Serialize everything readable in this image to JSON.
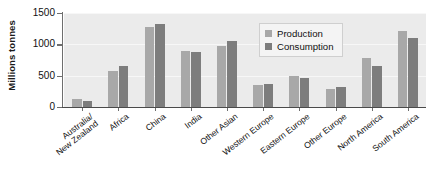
{
  "chart_data": {
    "type": "bar",
    "title": "",
    "xlabel": "",
    "ylabel": "Millions tonnes",
    "ylim": [
      0,
      1500
    ],
    "yticks": [
      0,
      500,
      1000,
      1500
    ],
    "ytick_labels": [
      "0",
      "500",
      "1000",
      "1500"
    ],
    "grid": true,
    "legend_position": "top-right-inside",
    "categories": [
      "Australia/\nNew Zealand",
      "Africa",
      "China",
      "India",
      "Other Asian",
      "Western Europe",
      "Eastern Europe",
      "Other Europe",
      "North America",
      "South America"
    ],
    "series": [
      {
        "name": "Production",
        "color": "#a8a8a8",
        "values": [
          120,
          580,
          1270,
          890,
          970,
          350,
          490,
          280,
          790,
          1210
        ]
      },
      {
        "name": "Consumption",
        "color": "#7d7d7d",
        "values": [
          90,
          660,
          1320,
          870,
          1060,
          360,
          470,
          320,
          650,
          1100
        ]
      }
    ]
  },
  "figure": {
    "plot_background": "#ebebeb",
    "page_background": "#ffffff",
    "axis_color": "#4a4a4a"
  }
}
